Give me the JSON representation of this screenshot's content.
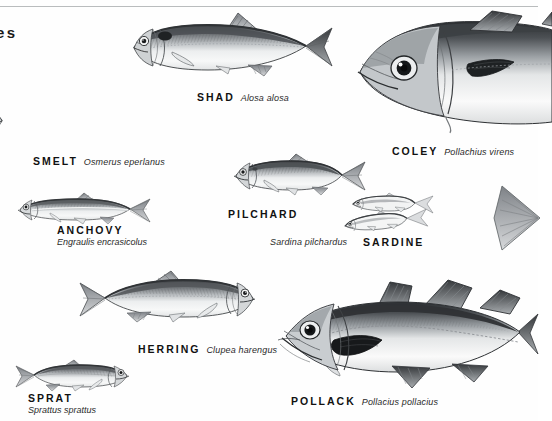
{
  "page": {
    "header_fragment": "es",
    "background_color": "#fefefe",
    "rule_color": "#b9bcbd",
    "ink_color": "#111111"
  },
  "species": [
    {
      "id": "shad",
      "common_name": "SHAD",
      "scientific_name": "Alosa alosa",
      "label_layout": "inline",
      "orientation": "facing-left"
    },
    {
      "id": "smelt",
      "common_name": "SMELT",
      "scientific_name": "Osmerus eperlanus",
      "label_layout": "inline",
      "orientation": "facing-right"
    },
    {
      "id": "coley",
      "common_name": "COLEY",
      "scientific_name": "Pollachius virens",
      "label_layout": "inline",
      "orientation": "facing-left"
    },
    {
      "id": "anchovy",
      "common_name": "ANCHOVY",
      "scientific_name": "Engraulis encrasicolus",
      "label_layout": "stacked",
      "orientation": "facing-left"
    },
    {
      "id": "pilchard",
      "common_name": "PILCHARD",
      "scientific_name": "Sardina pilchardus",
      "label_layout": "split",
      "orientation": "facing-left"
    },
    {
      "id": "sardine",
      "common_name": "SARDINE",
      "scientific_name": "",
      "label_layout": "name-only",
      "orientation": "pair-facing-left"
    },
    {
      "id": "herring",
      "common_name": "HERRING",
      "scientific_name": "Clupea harengus",
      "label_layout": "inline",
      "orientation": "facing-right"
    },
    {
      "id": "sprat",
      "common_name": "SPRAT",
      "scientific_name": "Sprattus sprattus",
      "label_layout": "stacked",
      "orientation": "facing-right"
    },
    {
      "id": "pollack",
      "common_name": "POLLACK",
      "scientific_name": "Pollacius pollacius",
      "label_layout": "inline",
      "orientation": "facing-left"
    }
  ]
}
